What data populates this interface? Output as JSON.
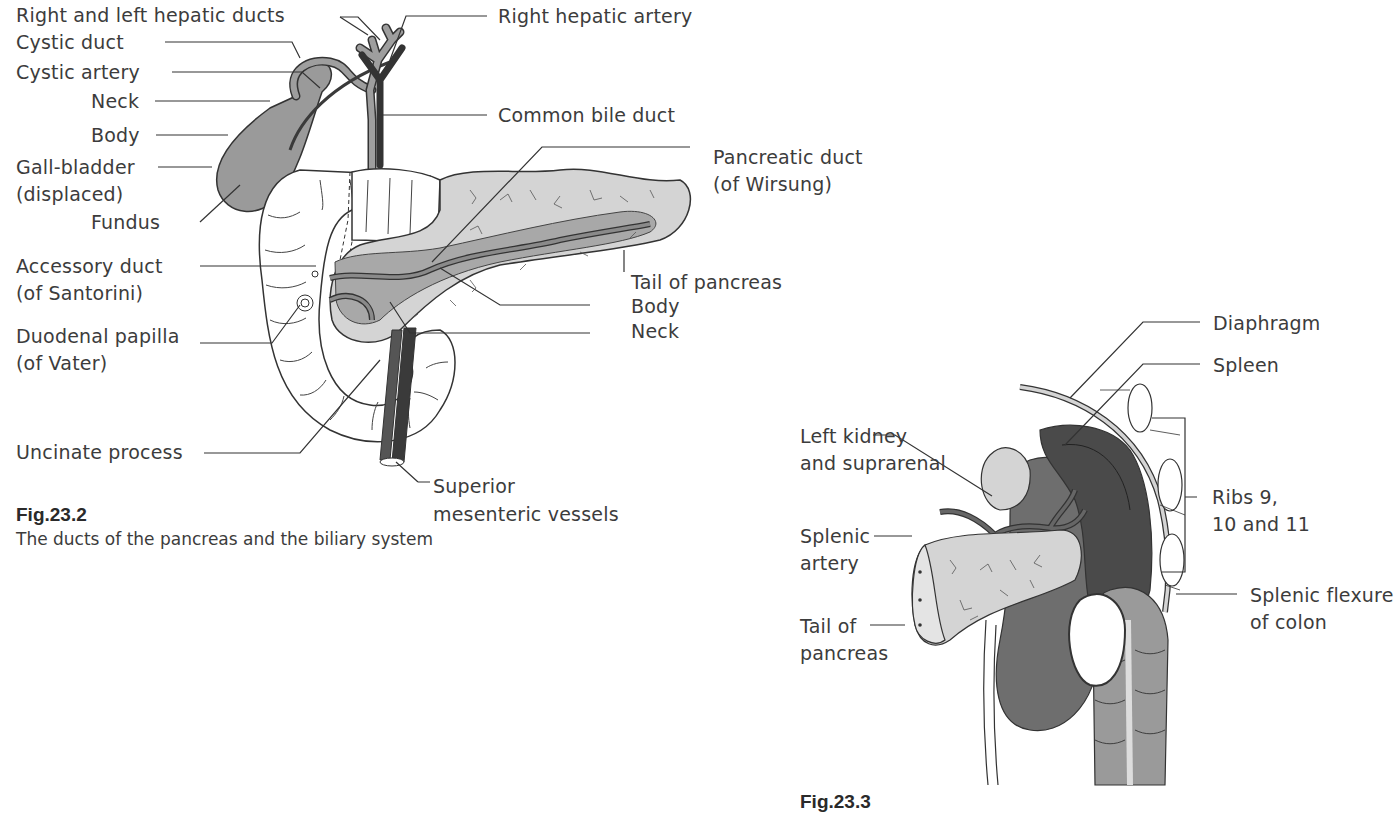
{
  "figure1": {
    "number": "Fig.23.2",
    "caption": "The ducts of the pancreas and the biliary system",
    "labels": {
      "hepatic_ducts": "Right and left hepatic ducts",
      "cystic_duct": "Cystic duct",
      "cystic_artery": "Cystic artery",
      "neck": "Neck",
      "body": "Body",
      "gallbladder_1": "Gall-bladder",
      "gallbladder_2": "(displaced)",
      "fundus": "Fundus",
      "accessory_duct_1": "Accessory duct",
      "accessory_duct_2": "(of Santorini)",
      "duodenal_papilla_1": "Duodenal papilla",
      "duodenal_papilla_2": "(of Vater)",
      "uncinate_process": "Uncinate process",
      "right_hepatic_artery": "Right hepatic artery",
      "common_bile_duct": "Common bile duct",
      "pancreatic_duct_1": "Pancreatic duct",
      "pancreatic_duct_2": "(of Wirsung)",
      "tail_of_pancreas": "Tail of pancreas",
      "pancreas_body": "Body",
      "pancreas_neck": "Neck",
      "sup_mesenteric_1": "Superior",
      "sup_mesenteric_2": "mesenteric vessels"
    }
  },
  "figure2": {
    "number": "Fig.23.3",
    "labels": {
      "diaphragm": "Diaphragm",
      "spleen": "Spleen",
      "left_kidney_1": "Left kidney",
      "left_kidney_2": "and suprarenal",
      "ribs_1": "Ribs 9,",
      "ribs_2": "10 and 11",
      "splenic_artery_1": "Splenic",
      "splenic_artery_2": "artery",
      "splenic_flexure_1": "Splenic flexure",
      "splenic_flexure_2": "of colon",
      "tail_1": "Tail of",
      "tail_2": "pancreas"
    }
  },
  "colors": {
    "organ_light": "#d4d4d4",
    "organ_mid": "#9a9a9a",
    "organ_dark": "#4a4a4a",
    "vessel_dark": "#3a3a3a",
    "line": "#333333"
  }
}
